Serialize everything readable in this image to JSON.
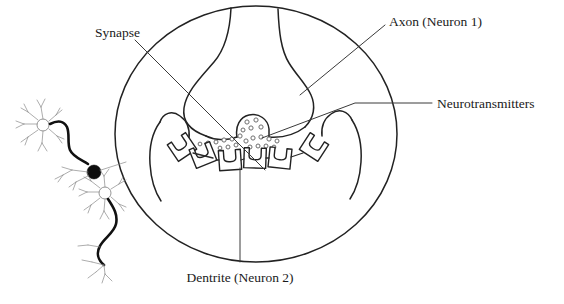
{
  "figure": {
    "background_color": "#ffffff",
    "line_color": "#222222"
  },
  "labels": {
    "synapse": "Synapse",
    "axon": "Axon (Neuron 1)",
    "neurotransmitters": "Neurotransmitters",
    "dendrite": "Dentrite (Neuron 2)"
  },
  "diagram": {
    "magnifier_circle": {
      "name": "magnified-synapse-circle",
      "cx": 256,
      "cy": 134,
      "rx": 141,
      "ry": 128
    },
    "parts": [
      {
        "name": "axon-terminal",
        "description": "presynaptic axon terminal bulb (Neuron 1)"
      },
      {
        "name": "synaptic-vesicle",
        "description": "vesicle releasing neurotransmitters"
      },
      {
        "name": "synaptic-cleft",
        "description": "gap between presynaptic and postsynaptic membranes"
      },
      {
        "name": "dendrite-membrane",
        "description": "postsynaptic dendrite membrane (Neuron 2)"
      },
      {
        "name": "receptors",
        "description": "six receptor proteins on the dendrite",
        "count": 6
      },
      {
        "name": "neurotransmitter-molecules",
        "description": "small circles diffusing across the cleft",
        "count": 18
      }
    ],
    "inset_neurons": {
      "name": "two-neuron-inset",
      "count": 2,
      "synapse_marker": "black filled dot where axon of neuron 1 meets dendrites of neuron 2"
    }
  },
  "leader_lines": [
    {
      "name": "leader-synapse",
      "from_label": "Synapse",
      "points": "135,40 265,170"
    },
    {
      "name": "leader-axon",
      "from_label": "Axon (Neuron 1)",
      "points": "385,25 300,95"
    },
    {
      "name": "leader-neurotransmitters",
      "from_label": "Neurotransmitters",
      "points": "432,103 355,103 262,138"
    },
    {
      "name": "leader-dendrite",
      "from_label": "Dentrite (Neuron 2)",
      "points": "240,168 240,262"
    }
  ]
}
